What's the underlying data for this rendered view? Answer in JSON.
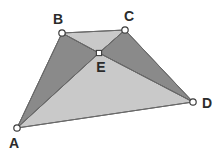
{
  "figure": {
    "background_color": "#ffffff",
    "width": 222,
    "height": 154,
    "outline_color": "#5a5a5a",
    "vertex_marker_fill": "#ffffff",
    "vertex_marker_stroke": "#3c3c3c",
    "label_color": "#2b2b2b",
    "shade_dark": "#8a8a8a",
    "shade_light": "#c9c9c9"
  },
  "points": {
    "A": {
      "label": "A",
      "x": 17,
      "y": 128,
      "label_x": 14,
      "label_y": 144,
      "marker": "circle"
    },
    "B": {
      "label": "B",
      "x": 62,
      "y": 33,
      "label_x": 58,
      "label_y": 20,
      "marker": "circle"
    },
    "C": {
      "label": "C",
      "x": 125,
      "y": 30,
      "label_x": 129,
      "label_y": 17,
      "marker": "circle"
    },
    "D": {
      "label": "D",
      "x": 193,
      "y": 102,
      "label_x": 207,
      "label_y": 104,
      "marker": "circle"
    },
    "E": {
      "label": "E",
      "x": 99,
      "y": 53,
      "label_x": 101,
      "label_y": 68,
      "marker": "square"
    }
  },
  "regions": [
    {
      "name": "triangle-ABE",
      "vertices": "A,B,E",
      "fill": "#8a8a8a",
      "shade": "dark",
      "points": "17,128 62,33 99,53"
    },
    {
      "name": "triangle-BCE",
      "vertices": "B,C,E",
      "fill": "#c9c9c9",
      "shade": "light",
      "points": "62,33 125,30 99,53"
    },
    {
      "name": "triangle-CDE",
      "vertices": "C,D,E",
      "fill": "#8a8a8a",
      "shade": "dark",
      "points": "125,30 193,102 99,53"
    },
    {
      "name": "triangle-ADE",
      "vertices": "A,D,E",
      "fill": "#c9c9c9",
      "shade": "light",
      "points": "17,128 193,102 99,53"
    }
  ],
  "segments": [
    {
      "name": "segment-AB",
      "from": "A",
      "to": "B",
      "x1": 17,
      "y1": 128,
      "x2": 62,
      "y2": 33
    },
    {
      "name": "segment-BC",
      "from": "B",
      "to": "C",
      "x1": 62,
      "y1": 33,
      "x2": 125,
      "y2": 30
    },
    {
      "name": "segment-CD",
      "from": "C",
      "to": "D",
      "x1": 125,
      "y1": 30,
      "x2": 193,
      "y2": 102
    },
    {
      "name": "segment-AD",
      "from": "A",
      "to": "D",
      "x1": 17,
      "y1": 128,
      "x2": 193,
      "y2": 102
    },
    {
      "name": "segment-AE",
      "from": "A",
      "to": "E",
      "x1": 17,
      "y1": 128,
      "x2": 99,
      "y2": 53
    },
    {
      "name": "segment-BE",
      "from": "B",
      "to": "E",
      "x1": 62,
      "y1": 33,
      "x2": 99,
      "y2": 53
    },
    {
      "name": "segment-CE",
      "from": "C",
      "to": "E",
      "x1": 125,
      "y1": 30,
      "x2": 99,
      "y2": 53
    },
    {
      "name": "segment-DE",
      "from": "D",
      "to": "E",
      "x1": 193,
      "y1": 102,
      "x2": 99,
      "y2": 53
    }
  ]
}
